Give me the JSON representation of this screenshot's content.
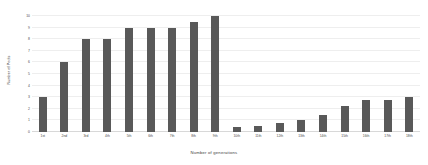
{
  "chart_data": {
    "type": "bar",
    "title": "",
    "xlabel": "Number of generations",
    "ylabel": "Number of Pools",
    "categories": [
      "1st",
      "2nd",
      "3rd",
      "4th",
      "5th",
      "6th",
      "7th",
      "8th",
      "9th",
      "10th",
      "11th",
      "12th",
      "13th",
      "14th",
      "15th",
      "16th",
      "17th",
      "18th"
    ],
    "values": [
      3,
      6,
      8,
      8,
      9,
      9,
      9,
      9.5,
      10,
      0.4,
      0.5,
      0.8,
      1,
      1.5,
      2.2,
      2.8,
      2.8,
      3
    ],
    "ylim": [
      0,
      10
    ],
    "yticks": [
      0,
      1,
      2,
      3,
      4,
      5,
      6,
      7,
      8,
      9,
      10
    ],
    "ytick_labels": [
      "0",
      "1",
      "2",
      "3",
      "4",
      "5",
      "6",
      "7",
      "8",
      "9",
      "10"
    ],
    "grid": true,
    "legend": false,
    "bar_color": "#595959",
    "grid_color": "#eeeeee",
    "background": "#ffffff"
  }
}
